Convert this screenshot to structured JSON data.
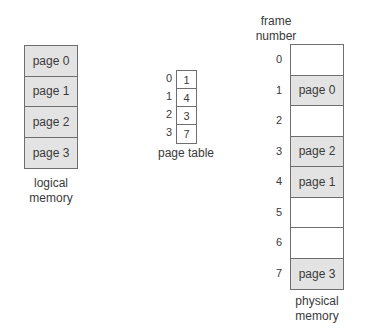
{
  "logical_memory": {
    "pages": [
      "page 0",
      "page 1",
      "page 2",
      "page 3"
    ],
    "caption_line1": "logical",
    "caption_line2": "memory"
  },
  "page_table": {
    "indices": [
      "0",
      "1",
      "2",
      "3"
    ],
    "frames": [
      "1",
      "4",
      "3",
      "7"
    ],
    "caption": "page table"
  },
  "physical_memory": {
    "header_line1": "frame",
    "header_line2": "number",
    "frames": [
      {
        "number": "0",
        "content": ""
      },
      {
        "number": "1",
        "content": "page 0"
      },
      {
        "number": "2",
        "content": ""
      },
      {
        "number": "3",
        "content": "page 2"
      },
      {
        "number": "4",
        "content": "page 1"
      },
      {
        "number": "5",
        "content": ""
      },
      {
        "number": "6",
        "content": ""
      },
      {
        "number": "7",
        "content": "page 3"
      }
    ],
    "caption_line1": "physical",
    "caption_line2": "memory"
  },
  "colors": {
    "filled_cell": "#e3e3e3",
    "border": "#6e6e6e",
    "text": "#3a3a3a"
  }
}
